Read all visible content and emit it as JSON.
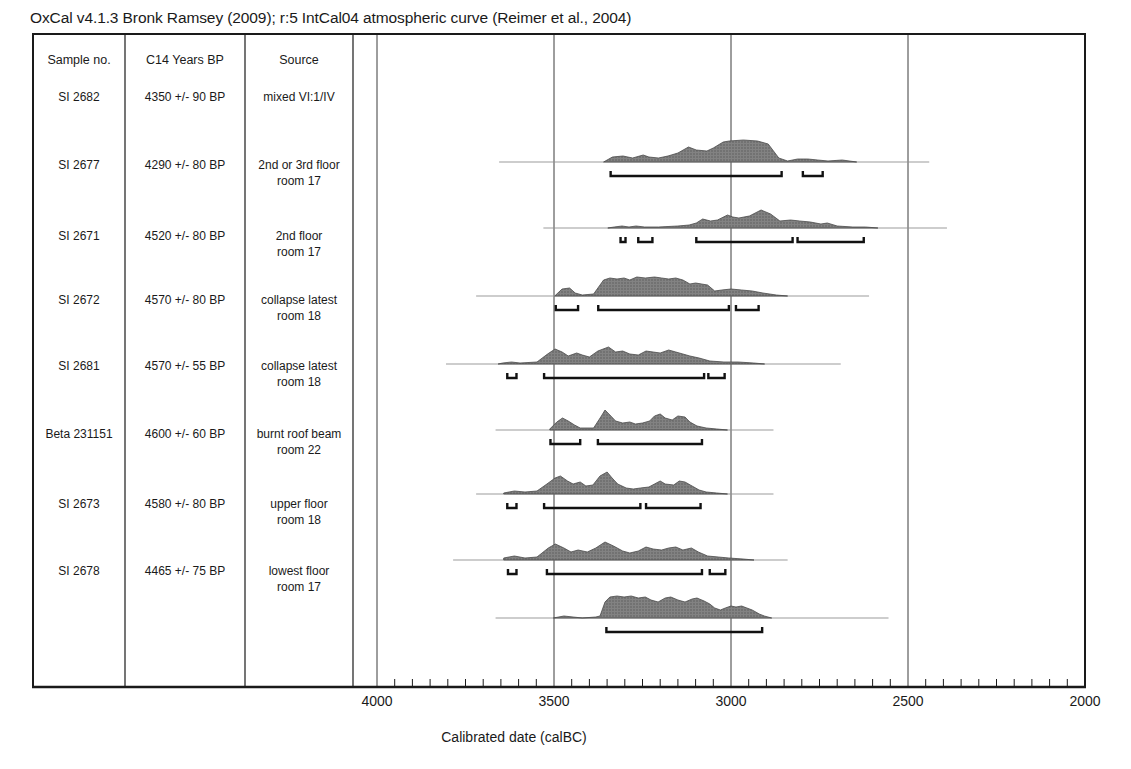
{
  "title": "OxCal v4.1.3 Bronk Ramsey (2009); r:5 IntCal04 atmospheric curve (Reimer et al., 2004)",
  "table": {
    "headers": [
      "Sample no.",
      "C14 Years BP",
      "Source"
    ]
  },
  "axis": {
    "label": "Calibrated date (calBC)",
    "major_ticks": [
      4000,
      3500,
      3000,
      2500,
      2000
    ],
    "minor_tick_step_years": 50,
    "range_calBC": [
      4000,
      2000
    ]
  },
  "colors": {
    "distribution_fill": "#828282",
    "distribution_stipple": "#595959",
    "distribution_outline": "#4a4a4a",
    "bracket": "#111111",
    "baseline_line": "#909090",
    "grid_line": "#3c3c3c",
    "frame": "#1a1a1a",
    "text": "#1a1a1a",
    "background": "#ffffff"
  },
  "chart_data": {
    "type": "area",
    "xlabel": "Calibrated date (calBC)",
    "x_range": [
      4000,
      2000
    ],
    "grid": "vertical-major-only",
    "series": [
      {
        "sample": "SI 2682",
        "c14_years_bp": "4350 +/- 90 BP",
        "source": [
          "mixed VI:1/IV"
        ],
        "span_line_calBC": [
          3655,
          2440
        ],
        "ranges_calBC": [
          [
            3340,
            2857
          ],
          [
            2797,
            2741
          ]
        ],
        "distribution": [
          [
            3360,
            0
          ],
          [
            3335,
            5
          ],
          [
            3305,
            6
          ],
          [
            3278,
            4
          ],
          [
            3248,
            7
          ],
          [
            3232,
            5
          ],
          [
            3205,
            4
          ],
          [
            3178,
            6
          ],
          [
            3150,
            9
          ],
          [
            3120,
            15
          ],
          [
            3098,
            12
          ],
          [
            3068,
            11
          ],
          [
            3050,
            14
          ],
          [
            3022,
            20
          ],
          [
            3005,
            21
          ],
          [
            2965,
            22
          ],
          [
            2925,
            21
          ],
          [
            2895,
            18
          ],
          [
            2880,
            11
          ],
          [
            2865,
            4
          ],
          [
            2840,
            1
          ],
          [
            2812,
            3
          ],
          [
            2783,
            3
          ],
          [
            2755,
            2
          ],
          [
            2726,
            1
          ],
          [
            2686,
            2
          ],
          [
            2645,
            0
          ]
        ]
      },
      {
        "sample": "SI 2677",
        "c14_years_bp": "4290 +/- 80 BP",
        "source": [
          "2nd or 3rd floor",
          "room 17"
        ],
        "span_line_calBC": [
          3530,
          2390
        ],
        "ranges_calBC": [
          [
            3312,
            3298
          ],
          [
            3262,
            3222
          ],
          [
            3098,
            2826
          ],
          [
            2812,
            2625
          ]
        ],
        "distribution": [
          [
            3348,
            0
          ],
          [
            3330,
            1
          ],
          [
            3308,
            2
          ],
          [
            3288,
            1
          ],
          [
            3268,
            2
          ],
          [
            3244,
            1
          ],
          [
            3205,
            1
          ],
          [
            3150,
            2
          ],
          [
            3118,
            3
          ],
          [
            3098,
            5
          ],
          [
            3080,
            9
          ],
          [
            3058,
            7
          ],
          [
            3038,
            8
          ],
          [
            3010,
            13
          ],
          [
            2995,
            11
          ],
          [
            2978,
            10
          ],
          [
            2948,
            12
          ],
          [
            2915,
            18
          ],
          [
            2888,
            14
          ],
          [
            2862,
            7
          ],
          [
            2832,
            8
          ],
          [
            2806,
            7
          ],
          [
            2776,
            6
          ],
          [
            2746,
            4
          ],
          [
            2728,
            5
          ],
          [
            2700,
            2
          ],
          [
            2656,
            1
          ],
          [
            2620,
            1
          ],
          [
            2585,
            0
          ]
        ]
      },
      {
        "sample": "SI 2671",
        "c14_years_bp": "4520 +/- 80 BP",
        "source": [
          "2nd floor",
          "room 17"
        ],
        "span_line_calBC": [
          3720,
          2610
        ],
        "ranges_calBC": [
          [
            3495,
            3432
          ],
          [
            3375,
            3006
          ],
          [
            2986,
            2922
          ]
        ],
        "distribution": [
          [
            3498,
            0
          ],
          [
            3477,
            7
          ],
          [
            3456,
            8
          ],
          [
            3440,
            3
          ],
          [
            3420,
            1
          ],
          [
            3388,
            2
          ],
          [
            3372,
            10
          ],
          [
            3360,
            16
          ],
          [
            3342,
            18
          ],
          [
            3322,
            17
          ],
          [
            3302,
            18
          ],
          [
            3286,
            16
          ],
          [
            3266,
            19
          ],
          [
            3242,
            18
          ],
          [
            3216,
            19
          ],
          [
            3196,
            18
          ],
          [
            3176,
            17
          ],
          [
            3156,
            18
          ],
          [
            3136,
            16
          ],
          [
            3116,
            12
          ],
          [
            3100,
            13
          ],
          [
            3066,
            11
          ],
          [
            3046,
            5
          ],
          [
            3026,
            6
          ],
          [
            3000,
            7
          ],
          [
            2970,
            6
          ],
          [
            2940,
            5
          ],
          [
            2910,
            3
          ],
          [
            2872,
            1
          ],
          [
            2840,
            0
          ]
        ]
      },
      {
        "sample": "SI 2672",
        "c14_years_bp": "4570 +/- 80 BP",
        "source": [
          "collapse latest",
          "room 18"
        ],
        "span_line_calBC": [
          3805,
          2690
        ],
        "ranges_calBC": [
          [
            3632,
            3606
          ],
          [
            3528,
            3076
          ],
          [
            3064,
            3018
          ]
        ],
        "distribution": [
          [
            3658,
            0
          ],
          [
            3645,
            1
          ],
          [
            3620,
            2
          ],
          [
            3596,
            1
          ],
          [
            3548,
            2
          ],
          [
            3518,
            10
          ],
          [
            3497,
            15
          ],
          [
            3477,
            12
          ],
          [
            3460,
            8
          ],
          [
            3436,
            11
          ],
          [
            3420,
            9
          ],
          [
            3400,
            7
          ],
          [
            3376,
            13
          ],
          [
            3346,
            17
          ],
          [
            3326,
            12
          ],
          [
            3306,
            13
          ],
          [
            3286,
            10
          ],
          [
            3262,
            9
          ],
          [
            3240,
            13
          ],
          [
            3220,
            12
          ],
          [
            3200,
            11
          ],
          [
            3176,
            14
          ],
          [
            3156,
            12
          ],
          [
            3136,
            10
          ],
          [
            3116,
            8
          ],
          [
            3090,
            6
          ],
          [
            3060,
            3
          ],
          [
            3020,
            2
          ],
          [
            2980,
            2
          ],
          [
            2936,
            1
          ],
          [
            2905,
            0
          ]
        ]
      },
      {
        "sample": "SI 2681",
        "c14_years_bp": "4570 +/- 55 BP",
        "source": [
          "collapse latest",
          "room 18"
        ],
        "span_line_calBC": [
          3665,
          2880
        ],
        "ranges_calBC": [
          [
            3510,
            3426
          ],
          [
            3376,
            3082
          ]
        ],
        "distribution": [
          [
            3512,
            1
          ],
          [
            3492,
            8
          ],
          [
            3476,
            12
          ],
          [
            3460,
            9
          ],
          [
            3442,
            5
          ],
          [
            3426,
            2
          ],
          [
            3388,
            2
          ],
          [
            3366,
            14
          ],
          [
            3356,
            20
          ],
          [
            3342,
            15
          ],
          [
            3326,
            9
          ],
          [
            3306,
            7
          ],
          [
            3286,
            8
          ],
          [
            3270,
            6
          ],
          [
            3250,
            7
          ],
          [
            3230,
            9
          ],
          [
            3216,
            14
          ],
          [
            3200,
            16
          ],
          [
            3186,
            12
          ],
          [
            3166,
            10
          ],
          [
            3150,
            14
          ],
          [
            3130,
            13
          ],
          [
            3116,
            8
          ],
          [
            3096,
            4
          ],
          [
            3070,
            2
          ],
          [
            3040,
            1
          ],
          [
            3010,
            0
          ]
        ]
      },
      {
        "sample": "Beta 231151",
        "c14_years_bp": "4600 +/- 60 BP",
        "source": [
          "burnt roof beam",
          "room 22"
        ],
        "span_line_calBC": [
          3720,
          2880
        ],
        "ranges_calBC": [
          [
            3632,
            3606
          ],
          [
            3528,
            3256
          ],
          [
            3240,
            3086
          ]
        ],
        "distribution": [
          [
            3642,
            1
          ],
          [
            3612,
            3
          ],
          [
            3582,
            2
          ],
          [
            3548,
            3
          ],
          [
            3520,
            10
          ],
          [
            3497,
            16
          ],
          [
            3482,
            18
          ],
          [
            3462,
            13
          ],
          [
            3446,
            10
          ],
          [
            3426,
            12
          ],
          [
            3410,
            8
          ],
          [
            3390,
            9
          ],
          [
            3370,
            18
          ],
          [
            3350,
            22
          ],
          [
            3336,
            16
          ],
          [
            3320,
            10
          ],
          [
            3296,
            6
          ],
          [
            3276,
            5
          ],
          [
            3256,
            6
          ],
          [
            3232,
            7
          ],
          [
            3216,
            10
          ],
          [
            3200,
            13
          ],
          [
            3186,
            10
          ],
          [
            3162,
            9
          ],
          [
            3146,
            13
          ],
          [
            3130,
            12
          ],
          [
            3110,
            8
          ],
          [
            3090,
            4
          ],
          [
            3070,
            2
          ],
          [
            3040,
            1
          ],
          [
            3010,
            0
          ]
        ]
      },
      {
        "sample": "SI 2673",
        "c14_years_bp": "4580 +/- 80 BP",
        "source": [
          "upper floor",
          "room 18"
        ],
        "span_line_calBC": [
          3785,
          2840
        ],
        "ranges_calBC": [
          [
            3630,
            3606
          ],
          [
            3520,
            3082
          ],
          [
            3060,
            3016
          ]
        ],
        "distribution": [
          [
            3642,
            2
          ],
          [
            3612,
            4
          ],
          [
            3582,
            2
          ],
          [
            3548,
            3
          ],
          [
            3516,
            12
          ],
          [
            3496,
            16
          ],
          [
            3472,
            12
          ],
          [
            3452,
            8
          ],
          [
            3432,
            10
          ],
          [
            3406,
            8
          ],
          [
            3382,
            12
          ],
          [
            3356,
            18
          ],
          [
            3332,
            14
          ],
          [
            3306,
            9
          ],
          [
            3286,
            7
          ],
          [
            3262,
            9
          ],
          [
            3240,
            13
          ],
          [
            3220,
            11
          ],
          [
            3196,
            10
          ],
          [
            3176,
            12
          ],
          [
            3156,
            13
          ],
          [
            3136,
            10
          ],
          [
            3112,
            12
          ],
          [
            3092,
            8
          ],
          [
            3066,
            4
          ],
          [
            3036,
            3
          ],
          [
            3006,
            2
          ],
          [
            2966,
            1
          ],
          [
            2935,
            0
          ]
        ]
      },
      {
        "sample": "SI 2678",
        "c14_years_bp": "4465 +/- 75 BP",
        "source": [
          "lowest floor",
          "room 17"
        ],
        "span_line_calBC": [
          3665,
          2555
        ],
        "ranges_calBC": [
          [
            3352,
            2912
          ]
        ],
        "distribution": [
          [
            3502,
            0
          ],
          [
            3472,
            2
          ],
          [
            3446,
            1
          ],
          [
            3420,
            0
          ],
          [
            3382,
            1
          ],
          [
            3370,
            2
          ],
          [
            3356,
            16
          ],
          [
            3342,
            21
          ],
          [
            3322,
            22
          ],
          [
            3302,
            21
          ],
          [
            3282,
            22
          ],
          [
            3262,
            20
          ],
          [
            3242,
            21
          ],
          [
            3226,
            18
          ],
          [
            3206,
            16
          ],
          [
            3186,
            20
          ],
          [
            3170,
            21
          ],
          [
            3150,
            18
          ],
          [
            3130,
            16
          ],
          [
            3110,
            19
          ],
          [
            3096,
            20
          ],
          [
            3076,
            17
          ],
          [
            3060,
            14
          ],
          [
            3046,
            10
          ],
          [
            3030,
            8
          ],
          [
            3016,
            10
          ],
          [
            3000,
            12
          ],
          [
            2986,
            11
          ],
          [
            2970,
            12
          ],
          [
            2955,
            10
          ],
          [
            2940,
            8
          ],
          [
            2920,
            4
          ],
          [
            2906,
            2
          ],
          [
            2885,
            0
          ]
        ]
      }
    ]
  }
}
